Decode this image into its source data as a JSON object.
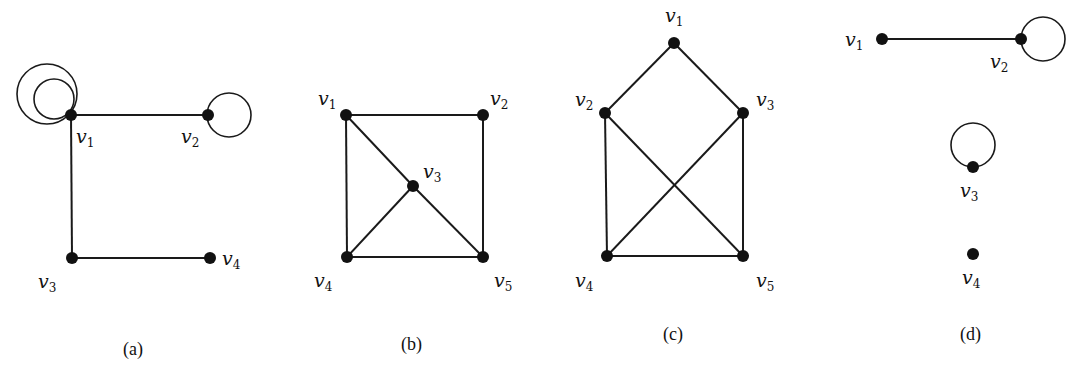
{
  "figure": {
    "graphs": [
      {
        "id": "a",
        "caption": "(a)",
        "vertices": [
          {
            "name": "v1",
            "letter": "v",
            "sub": "1",
            "x": 71,
            "y": 115,
            "lx": 76,
            "ly": 143
          },
          {
            "name": "v2",
            "letter": "v",
            "sub": "2",
            "x": 208,
            "y": 115,
            "lx": 181,
            "ly": 143
          },
          {
            "name": "v3",
            "letter": "v",
            "sub": "3",
            "x": 72,
            "y": 258,
            "lx": 38,
            "ly": 288
          },
          {
            "name": "v4",
            "letter": "v",
            "sub": "4",
            "x": 210,
            "y": 258,
            "lx": 222,
            "ly": 265
          }
        ],
        "edges": [
          [
            "v1",
            "v2"
          ],
          [
            "v1",
            "v3"
          ],
          [
            "v3",
            "v4"
          ]
        ],
        "loops": [
          {
            "vertex": "v1",
            "cx": 47,
            "cy": 94,
            "r": 30
          },
          {
            "vertex": "v1",
            "cx": 54,
            "cy": 99,
            "r": 20
          },
          {
            "vertex": "v2",
            "cx": 229,
            "cy": 115,
            "r": 22
          }
        ]
      },
      {
        "id": "b",
        "caption": "(b)",
        "vertices": [
          {
            "name": "v1",
            "letter": "v",
            "sub": "1",
            "x": 346,
            "y": 115,
            "lx": 318,
            "ly": 105
          },
          {
            "name": "v2",
            "letter": "v",
            "sub": "2",
            "x": 483,
            "y": 115,
            "lx": 490,
            "ly": 105
          },
          {
            "name": "v3",
            "letter": "v",
            "sub": "3",
            "x": 413,
            "y": 186,
            "lx": 423,
            "ly": 178
          },
          {
            "name": "v4",
            "letter": "v",
            "sub": "4",
            "x": 347,
            "y": 257,
            "lx": 314,
            "ly": 287
          },
          {
            "name": "v5",
            "letter": "v",
            "sub": "5",
            "x": 483,
            "y": 257,
            "lx": 494,
            "ly": 287
          }
        ],
        "edges": [
          [
            "v1",
            "v2"
          ],
          [
            "v1",
            "v4"
          ],
          [
            "v2",
            "v5"
          ],
          [
            "v4",
            "v5"
          ],
          [
            "v1",
            "v3"
          ],
          [
            "v3",
            "v5"
          ],
          [
            "v3",
            "v4"
          ]
        ],
        "loops": []
      },
      {
        "id": "c",
        "caption": "(c)",
        "vertices": [
          {
            "name": "v1",
            "letter": "v",
            "sub": "1",
            "x": 674,
            "y": 43,
            "lx": 665,
            "ly": 22
          },
          {
            "name": "v2",
            "letter": "v",
            "sub": "2",
            "x": 605,
            "y": 113,
            "lx": 575,
            "ly": 106
          },
          {
            "name": "v3",
            "letter": "v",
            "sub": "3",
            "x": 743,
            "y": 113,
            "lx": 756,
            "ly": 106
          },
          {
            "name": "v4",
            "letter": "v",
            "sub": "4",
            "x": 607,
            "y": 256,
            "lx": 575,
            "ly": 287
          },
          {
            "name": "v5",
            "letter": "v",
            "sub": "5",
            "x": 743,
            "y": 256,
            "lx": 756,
            "ly": 287
          }
        ],
        "edges": [
          [
            "v1",
            "v2"
          ],
          [
            "v1",
            "v3"
          ],
          [
            "v2",
            "v4"
          ],
          [
            "v3",
            "v5"
          ],
          [
            "v4",
            "v5"
          ],
          [
            "v2",
            "v5"
          ],
          [
            "v3",
            "v4"
          ]
        ],
        "loops": []
      },
      {
        "id": "d",
        "caption": "(d)",
        "vertices": [
          {
            "name": "v1",
            "letter": "v",
            "sub": "1",
            "x": 882,
            "y": 39,
            "lx": 845,
            "ly": 46
          },
          {
            "name": "v2",
            "letter": "v",
            "sub": "2",
            "x": 1021,
            "y": 39,
            "lx": 990,
            "ly": 68
          },
          {
            "name": "v3",
            "letter": "v",
            "sub": "3",
            "x": 973,
            "y": 167,
            "lx": 960,
            "ly": 197
          },
          {
            "name": "v4",
            "letter": "v",
            "sub": "4",
            "x": 973,
            "y": 254,
            "lx": 962,
            "ly": 284
          }
        ],
        "edges": [
          [
            "v1",
            "v2"
          ]
        ],
        "loops": [
          {
            "vertex": "v2",
            "cx": 1043,
            "cy": 39,
            "r": 22
          },
          {
            "vertex": "v3",
            "cx": 973,
            "cy": 145,
            "r": 22
          }
        ]
      }
    ],
    "captions": [
      {
        "text": "(a)",
        "x": 123,
        "y": 355
      },
      {
        "text": "(b)",
        "x": 401,
        "y": 350
      },
      {
        "text": "(c)",
        "x": 663,
        "y": 340
      },
      {
        "text": "(d)",
        "x": 960,
        "y": 340
      }
    ]
  }
}
